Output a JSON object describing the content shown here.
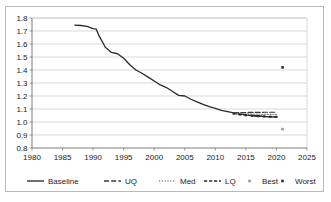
{
  "chart_data": {
    "type": "line",
    "title": "",
    "subtitle": "",
    "xlabel": "",
    "ylabel": "",
    "xlim": [
      1980,
      2025
    ],
    "ylim": [
      0.8,
      1.8
    ],
    "grid": true,
    "grid_axis": "y",
    "legend_position": "bottom",
    "xticks": [
      "1980",
      "1985",
      "1990",
      "1995",
      "2000",
      "2005",
      "2010",
      "2015",
      "2020",
      "2025"
    ],
    "yticks": [
      "0.8",
      "0.9",
      "1.0",
      "1.1",
      "1.2",
      "1.3",
      "1.4",
      "1.5",
      "1.6",
      "1.7",
      "1.8"
    ],
    "series": [
      {
        "name": "Baseline",
        "style": "solid",
        "color": "#2b2b2b",
        "x": [
          1987,
          1988,
          1989,
          1990,
          1990.5,
          1991,
          1992,
          1993,
          1994,
          1995,
          1996,
          1997,
          1998,
          1999,
          2000,
          2001,
          2002,
          2003,
          2004,
          2005,
          2006,
          2007,
          2008,
          2009,
          2010,
          2011,
          2012,
          2013,
          2014,
          2015,
          2016,
          2017,
          2018,
          2019,
          2020
        ],
        "values": [
          1.745,
          1.742,
          1.735,
          1.718,
          1.715,
          1.66,
          1.575,
          1.535,
          1.525,
          1.49,
          1.44,
          1.4,
          1.375,
          1.345,
          1.315,
          1.285,
          1.265,
          1.235,
          1.205,
          1.2,
          1.175,
          1.155,
          1.135,
          1.118,
          1.105,
          1.09,
          1.08,
          1.07,
          1.062,
          1.055,
          1.05,
          1.046,
          1.042,
          1.04,
          1.038
        ]
      },
      {
        "name": "UQ",
        "style": "long-dash",
        "color": "#3a3a3a",
        "x": [
          2013,
          2014,
          2015,
          2016,
          2017,
          2018,
          2019,
          2020
        ],
        "values": [
          1.07,
          1.072,
          1.073,
          1.074,
          1.074,
          1.075,
          1.075,
          1.075
        ]
      },
      {
        "name": "Med",
        "style": "dotted",
        "color": "#8d8d8d",
        "x": [
          2013,
          2014,
          2015,
          2016,
          2017,
          2018,
          2019,
          2020
        ],
        "values": [
          1.068,
          1.065,
          1.063,
          1.061,
          1.06,
          1.059,
          1.058,
          1.058
        ]
      },
      {
        "name": "LQ",
        "style": "dash",
        "color": "#2b2b2b",
        "x": [
          2013,
          2014,
          2015,
          2016,
          2017,
          2018,
          2019,
          2020
        ],
        "values": [
          1.065,
          1.058,
          1.052,
          1.048,
          1.045,
          1.043,
          1.041,
          1.04
        ]
      },
      {
        "name": "Best",
        "style": "marker",
        "color": "#9a9a9a",
        "x": [
          2021
        ],
        "values": [
          0.945
        ]
      },
      {
        "name": "Worst",
        "style": "marker",
        "color": "#2b2b2b",
        "x": [
          2021
        ],
        "values": [
          1.42
        ]
      }
    ]
  },
  "legend": {
    "items": [
      {
        "label": "Baseline",
        "key": "baseline"
      },
      {
        "label": "UQ",
        "key": "uq"
      },
      {
        "label": "Med",
        "key": "med"
      },
      {
        "label": "LQ",
        "key": "lq"
      },
      {
        "label": "Best",
        "key": "best"
      },
      {
        "label": "Worst",
        "key": "worst"
      }
    ]
  },
  "colors": {
    "frame": "#b9b9b9",
    "grid": "#c9c9c9",
    "axis": "#6e6e6e",
    "text": "#1a1a1a",
    "baseline": "#2b2b2b",
    "uq": "#3a3a3a",
    "med": "#8d8d8d",
    "lq": "#2b2b2b",
    "best": "#9a9a9a",
    "worst": "#2b2b2b",
    "background": "#ffffff"
  }
}
